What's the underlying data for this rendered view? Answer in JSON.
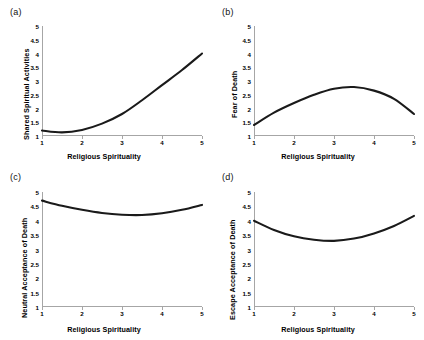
{
  "figure": {
    "background": "#ffffff",
    "curve_color": "#1a1a1a",
    "axis_color": "#a6a6a6"
  },
  "panels": [
    {
      "tag": "(a)",
      "xlabel": "Religious Spirituality",
      "ylabel": "Shared Spiritual Activities",
      "xticks": [
        "1",
        "2",
        "3",
        "4",
        "5"
      ],
      "yticks": [
        "1",
        "1.5",
        "2",
        "2.5",
        "3",
        "3.5",
        "4",
        "4.5",
        "5"
      ]
    },
    {
      "tag": "(b)",
      "xlabel": "Religious Spirituality",
      "ylabel": "Fear of Death",
      "xticks": [
        "1",
        "2",
        "3",
        "4",
        "5"
      ],
      "yticks": [
        "1",
        "1.5",
        "2",
        "2.5",
        "3",
        "3.5",
        "4",
        "4.5",
        "5"
      ]
    },
    {
      "tag": "(c)",
      "xlabel": "Religious Spirituality",
      "ylabel": "Neutral Acceptance of Death",
      "xticks": [
        "1",
        "2",
        "3",
        "4",
        "5"
      ],
      "yticks": [
        "1",
        "1.5",
        "2",
        "2.5",
        "3",
        "3.5",
        "4",
        "4.5",
        "5"
      ]
    },
    {
      "tag": "(d)",
      "xlabel": "Religious Spirituality",
      "ylabel": "Escape Acceptance of Death",
      "xticks": [
        "1",
        "2",
        "3",
        "4",
        "5"
      ],
      "yticks": [
        "1",
        "1.5",
        "2",
        "2.5",
        "3",
        "3.5",
        "4",
        "4.5",
        "5"
      ]
    }
  ],
  "chart_data": [
    {
      "type": "line",
      "title": "(a)",
      "xlabel": "Religious Spirituality",
      "ylabel": "Shared Spiritual Activities",
      "xlim": [
        1,
        5
      ],
      "ylim": [
        1,
        5
      ],
      "xticks": [
        1,
        2,
        3,
        4,
        5
      ],
      "yticks": [
        1,
        1.5,
        2,
        2.5,
        3,
        3.5,
        4,
        4.5,
        5
      ],
      "grid": false,
      "legend": "none",
      "shape": "upward-curving convex (quadratic), shallow minimum near x=1.6",
      "x": [
        1,
        1.5,
        2,
        2.5,
        3,
        3.5,
        4,
        4.5,
        5
      ],
      "y": [
        1.2,
        1.13,
        1.22,
        1.45,
        1.8,
        2.3,
        2.85,
        3.4,
        4.0
      ]
    },
    {
      "type": "line",
      "title": "(b)",
      "xlabel": "Religious Spirituality",
      "ylabel": "Fear of Death",
      "xlim": [
        1,
        5
      ],
      "ylim": [
        1,
        5
      ],
      "xticks": [
        1,
        2,
        3,
        4,
        5
      ],
      "yticks": [
        1,
        1.5,
        2,
        2.5,
        3,
        3.5,
        4,
        4.5,
        5
      ],
      "grid": false,
      "legend": "none",
      "shape": "inverted-U (concave), peak about 2.78 near x=3.2",
      "x": [
        1,
        1.5,
        2,
        2.5,
        3,
        3.5,
        4,
        4.5,
        5
      ],
      "y": [
        1.4,
        1.85,
        2.2,
        2.5,
        2.72,
        2.78,
        2.65,
        2.35,
        1.8
      ]
    },
    {
      "type": "line",
      "title": "(c)",
      "xlabel": "Religious Spirituality",
      "ylabel": "Neutral Acceptance of Death",
      "xlim": [
        1,
        5
      ],
      "ylim": [
        1,
        5
      ],
      "xticks": [
        1,
        2,
        3,
        4,
        5
      ],
      "yticks": [
        1,
        1.5,
        2,
        2.5,
        3,
        3.5,
        4,
        4.5,
        5
      ],
      "grid": false,
      "legend": "none",
      "shape": "shallow U (convex), minimum about 4.2 near x=3.2",
      "x": [
        1,
        1.5,
        2,
        2.5,
        3,
        3.5,
        4,
        4.5,
        5
      ],
      "y": [
        4.7,
        4.52,
        4.38,
        4.27,
        4.21,
        4.2,
        4.26,
        4.38,
        4.55
      ]
    },
    {
      "type": "line",
      "title": "(d)",
      "xlabel": "Religious Spirituality",
      "ylabel": "Escape Acceptance of Death",
      "xlim": [
        1,
        5
      ],
      "ylim": [
        1,
        5
      ],
      "xticks": [
        1,
        2,
        3,
        4,
        5
      ],
      "yticks": [
        1,
        1.5,
        2,
        2.5,
        3,
        3.5,
        4,
        4.5,
        5
      ],
      "grid": false,
      "legend": "none",
      "shape": "U-shaped (convex), minimum about 3.3 near x=2.9",
      "x": [
        1,
        1.5,
        2,
        2.5,
        3,
        3.5,
        4,
        4.5,
        5
      ],
      "y": [
        4.0,
        3.68,
        3.46,
        3.34,
        3.3,
        3.38,
        3.56,
        3.82,
        4.17
      ]
    }
  ]
}
